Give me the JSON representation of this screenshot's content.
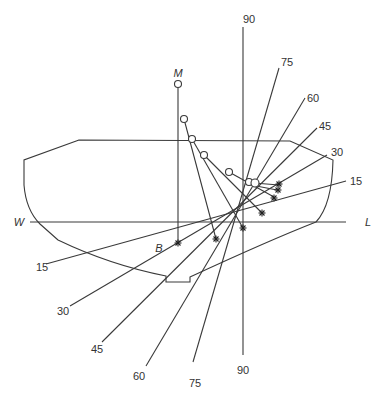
{
  "diagram": {
    "type": "ship-stability-diagram",
    "labels": {
      "metacentre": "M",
      "buoyancy": "B",
      "waterline_left": "W",
      "waterline_right": "L"
    },
    "heel_angles": [
      "15",
      "30",
      "45",
      "60",
      "75",
      "90"
    ],
    "heel_lines": [
      {
        "angle": "15",
        "top_label": "15",
        "bottom_label": "15"
      },
      {
        "angle": "30",
        "top_label": "30",
        "bottom_label": "30"
      },
      {
        "angle": "45",
        "top_label": "45",
        "bottom_label": "45"
      },
      {
        "angle": "60",
        "top_label": "60",
        "bottom_label": "60"
      },
      {
        "angle": "75",
        "top_label": "75",
        "bottom_label": "75"
      },
      {
        "angle": "90",
        "top_label": "90",
        "bottom_label": "90"
      }
    ],
    "metacentre_locus_points": 7,
    "buoyancy_locus_points": 7,
    "colors": {
      "line": "#3a3a3a",
      "background": "#ffffff"
    }
  }
}
